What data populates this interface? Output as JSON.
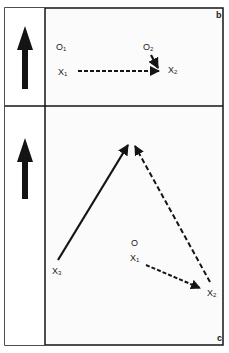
{
  "colors": {
    "ink": "#141414",
    "background": "#ffffff",
    "panel_bg": "#fbfbfb"
  },
  "panel_b": {
    "letter": "b",
    "labels": {
      "o1": "O",
      "o1_sub": "1",
      "o2": "O",
      "o2_sub": "2",
      "x1": "X",
      "x1_sub": "1",
      "x2": "X",
      "x2_sub": "2"
    }
  },
  "panel_c": {
    "letter": "c",
    "labels": {
      "o": "O",
      "x1": "X",
      "x1_sub": "1",
      "x2": "X",
      "x2_sub": "2",
      "x3": "X",
      "x3_sub": "3"
    }
  },
  "sidebar": {
    "icons": [
      "up-arrow-icon",
      "up-arrow-icon"
    ]
  }
}
